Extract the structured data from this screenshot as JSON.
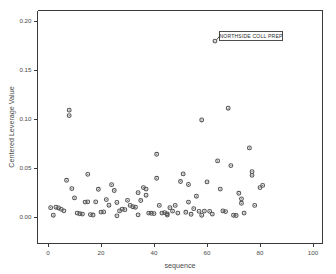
{
  "chart_data": {
    "type": "scatter",
    "title": "",
    "xlabel": "sequence",
    "ylabel": "Centered Leverage Value",
    "xlim": [
      -5,
      107
    ],
    "ylim": [
      -0.012,
      0.213
    ],
    "xticks": [
      0,
      20,
      40,
      60,
      80,
      100
    ],
    "xticklabels": [
      "0",
      "20",
      "40",
      "60",
      "80",
      "100"
    ],
    "yticks": [
      0.0,
      0.05,
      0.1,
      0.15,
      0.2
    ],
    "yticklabels": [
      "0.00",
      "0.05",
      "0.10",
      "0.15",
      "0.20"
    ],
    "grid": false,
    "legend": null,
    "marker": "open-circle",
    "marker_color": "#666666",
    "series": [
      {
        "name": "Centered Leverage Value",
        "points": [
          [
            1,
            0.0095
          ],
          [
            2,
            0.0018
          ],
          [
            3,
            0.01
          ],
          [
            4,
            0.0092
          ],
          [
            5,
            0.0078
          ],
          [
            6,
            0.0063
          ],
          [
            7,
            0.0375
          ],
          [
            8,
            0.109
          ],
          [
            8,
            0.1035
          ],
          [
            9,
            0.029
          ],
          [
            10,
            0.0195
          ],
          [
            11,
            0.004
          ],
          [
            12,
            0.0033
          ],
          [
            13,
            0.003
          ],
          [
            14,
            0.0152
          ],
          [
            15,
            0.0155
          ],
          [
            15,
            0.0435
          ],
          [
            16,
            0.0025
          ],
          [
            17,
            0.002
          ],
          [
            18,
            0.0155
          ],
          [
            19,
            0.0283
          ],
          [
            20,
            0.005
          ],
          [
            21,
            0.0052
          ],
          [
            22,
            0.0178
          ],
          [
            23,
            0.012
          ],
          [
            24,
            0.033
          ],
          [
            25,
            0.027
          ],
          [
            26,
            0.0148
          ],
          [
            26,
            0.0012
          ],
          [
            27,
            0.0062
          ],
          [
            28,
            0.008
          ],
          [
            29,
            0.0075
          ],
          [
            30,
            0.017
          ],
          [
            31,
            0.0118
          ],
          [
            32,
            0.0105
          ],
          [
            33,
            0.01
          ],
          [
            34,
            0.0248
          ],
          [
            34,
            0.0022
          ],
          [
            35,
            0.0168
          ],
          [
            36,
            0.03
          ],
          [
            37,
            0.0222
          ],
          [
            37,
            0.0285
          ],
          [
            38,
            0.004
          ],
          [
            39,
            0.0038
          ],
          [
            40,
            0.0035
          ],
          [
            41,
            0.064
          ],
          [
            41,
            0.0395
          ],
          [
            42,
            0.0118
          ],
          [
            43,
            0.004
          ],
          [
            44,
            0.0045
          ],
          [
            45,
            0.0032
          ],
          [
            45,
            0.002
          ],
          [
            46,
            0.0095
          ],
          [
            47,
            0.006
          ],
          [
            48,
            0.0118
          ],
          [
            49,
            0.004
          ],
          [
            50,
            0.0362
          ],
          [
            51,
            0.044
          ],
          [
            52,
            0.0048
          ],
          [
            53,
            0.0332
          ],
          [
            53,
            0.0152
          ],
          [
            54,
            0.0028
          ],
          [
            55,
            0.0085
          ],
          [
            56,
            0.0212
          ],
          [
            57,
            0.0058
          ],
          [
            58,
            0.099
          ],
          [
            58,
            0.0018
          ],
          [
            59,
            0.006
          ],
          [
            60,
            0.0358
          ],
          [
            61,
            0.0058
          ],
          [
            62,
            0.003
          ],
          [
            63,
            0.1795
          ],
          [
            64,
            0.0572
          ],
          [
            65,
            0.0285
          ],
          [
            66,
            0.0062
          ],
          [
            67,
            0.0055
          ],
          [
            68,
            0.111
          ],
          [
            69,
            0.0525
          ],
          [
            70,
            0.0018
          ],
          [
            71,
            0.0015
          ],
          [
            72,
            0.0242
          ],
          [
            73,
            0.0185
          ],
          [
            73,
            0.014
          ],
          [
            74,
            0.004
          ],
          [
            76,
            0.0705
          ],
          [
            77,
            0.0425
          ],
          [
            77,
            0.0462
          ],
          [
            78,
            0.0118
          ],
          [
            80,
            0.03
          ],
          [
            81,
            0.0322
          ]
        ]
      }
    ],
    "annotations": [
      {
        "text": "NORTHSIDE COLL PREP",
        "point": [
          63,
          0.1795
        ],
        "box_anchor": "right"
      }
    ]
  }
}
